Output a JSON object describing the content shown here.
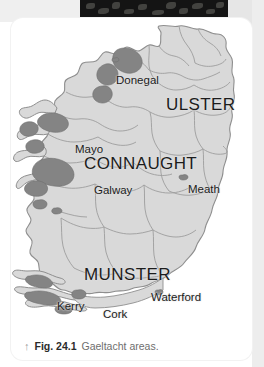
{
  "figure": {
    "caption_arrow": "up-arrow",
    "caption_arrow_glyph": "↑",
    "caption_number": "Fig. 24.1",
    "caption_text": "Gaeltacht areas."
  },
  "map": {
    "title_alt": "Map of Ireland showing Gaeltacht areas",
    "colors": {
      "land": "#d9d9d9",
      "land_border": "#8e8e8e",
      "gaeltacht": "#848484",
      "background": "#ffffff",
      "label": "#1c1c1c"
    },
    "provinces": [
      {
        "name": "ULSTER",
        "x": 155,
        "y": 78
      },
      {
        "name": "CONNAUGHT",
        "x": 73,
        "y": 137
      },
      {
        "name": "MUNSTER",
        "x": 73,
        "y": 248
      }
    ],
    "counties": [
      {
        "name": "Donegal",
        "x": 105,
        "y": 57
      },
      {
        "name": "Mayo",
        "x": 64,
        "y": 126
      },
      {
        "name": "Galway",
        "x": 83,
        "y": 167
      },
      {
        "name": "Meath",
        "x": 177,
        "y": 166
      },
      {
        "name": "Kerry",
        "x": 46,
        "y": 283
      },
      {
        "name": "Cork",
        "x": 92,
        "y": 291
      },
      {
        "name": "Waterford",
        "x": 140,
        "y": 274
      }
    ],
    "legend_note": "Shaded dark areas indicate Gaeltacht regions"
  }
}
